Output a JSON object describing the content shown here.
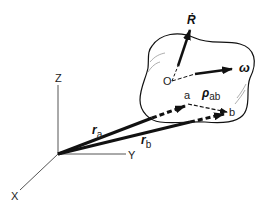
{
  "diagram": {
    "type": "rigid-body-kinematics",
    "axes": {
      "x_label": "X",
      "y_label": "Y",
      "z_label": "Z"
    },
    "body": {
      "origin_label": "O",
      "velocity_label": "Ṙ",
      "angular_velocity_label": "ω"
    },
    "points": {
      "a_label": "a",
      "b_label": "b"
    },
    "vectors": {
      "r_a_main": "r",
      "r_a_sub": "a",
      "r_b_main": "r",
      "r_b_sub": "b",
      "rho_main": "ρ",
      "rho_sub": "ab"
    },
    "colors": {
      "stroke": "#111111",
      "axis": "#555555",
      "background": "#ffffff"
    }
  }
}
